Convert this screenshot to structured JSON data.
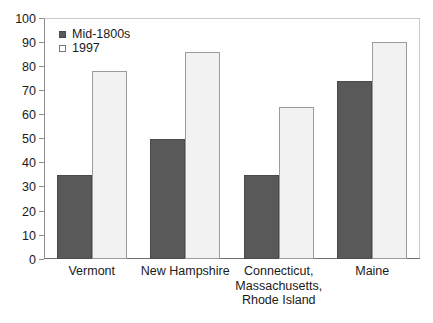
{
  "chart_data": {
    "type": "bar",
    "title": "",
    "subtitle": "",
    "xlabel": "",
    "ylabel": "",
    "ylim": [
      0,
      100
    ],
    "yticks": [
      0,
      10,
      20,
      30,
      40,
      50,
      60,
      70,
      80,
      90,
      100
    ],
    "ytick_labels": [
      "0",
      "10",
      "20",
      "30",
      "40",
      "50",
      "60",
      "70",
      "80",
      "90",
      "100"
    ],
    "grid": false,
    "legend_position": "upper-left-inside",
    "categories": [
      "Vermont",
      "New Hampshire",
      "Connecticut,\nMassachusetts,\nRhode Island",
      "Maine"
    ],
    "category_lines": [
      [
        "Vermont"
      ],
      [
        "New Hampshire"
      ],
      [
        "Connecticut,",
        "Massachusetts,",
        "Rhode Island"
      ],
      [
        "Maine"
      ]
    ],
    "series": [
      {
        "name": "Mid-1800s",
        "color": "#595959",
        "values": [
          35,
          50,
          35,
          74
        ]
      },
      {
        "name": "1997",
        "color": "#f2f2f2",
        "values": [
          78,
          86,
          63,
          90
        ]
      }
    ]
  },
  "legend": {
    "items": [
      {
        "label": "Mid-1800s",
        "swatch": "filled-dark-square"
      },
      {
        "label": "1997",
        "swatch": "outlined-white-square"
      }
    ]
  },
  "colors": {
    "series_old": "#595959",
    "series_new": "#f2f2f2",
    "axis": "#6e6e6e",
    "text": "#1a1a1a",
    "background": "#ffffff"
  }
}
